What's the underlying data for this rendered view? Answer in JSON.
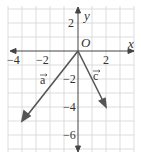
{
  "diagram": {
    "type": "coordinate-plane-vectors",
    "axes": {
      "x_label": "x",
      "y_label": "y",
      "origin_label": "O",
      "x_range": [
        -5,
        4
      ],
      "y_range": [
        -7,
        3
      ],
      "x_ticks": [
        {
          "value": -4,
          "label": "−4"
        },
        {
          "value": -2,
          "label": "−2"
        },
        {
          "value": 2,
          "label": "2"
        }
      ],
      "y_ticks": [
        {
          "value": 2,
          "label": "2"
        },
        {
          "value": -2,
          "label": "−2"
        },
        {
          "value": -4,
          "label": "−4"
        },
        {
          "value": -6,
          "label": "−6"
        }
      ]
    },
    "vectors": [
      {
        "name": "a",
        "label": "a",
        "from": [
          0,
          0
        ],
        "to": [
          -4,
          -5
        ]
      },
      {
        "name": "c",
        "label": "c",
        "from": [
          0,
          0
        ],
        "to": [
          2,
          -4
        ]
      }
    ],
    "colors": {
      "grid": "#d4d4d4",
      "axis": "#444444",
      "vector": "#555555",
      "text": "#333333"
    }
  }
}
